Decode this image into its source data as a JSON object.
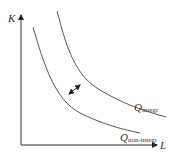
{
  "diagram": {
    "type": "isoquant",
    "axes": {
      "y_label": "K",
      "x_label": "L"
    },
    "curves": [
      {
        "id": "integr",
        "label_main": "Q",
        "label_sub": "integr"
      },
      {
        "id": "non-integr",
        "label_main": "Q",
        "label_sub": "non-integr"
      }
    ],
    "arrow": {
      "type": "double-headed",
      "meaning": "shift between isoquants"
    },
    "colors": {
      "line": "#333333",
      "background": "#ffffff"
    }
  }
}
